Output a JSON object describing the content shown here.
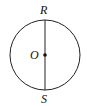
{
  "diagram": {
    "type": "circle-with-diameter",
    "circle": {
      "cx": 45,
      "cy": 55,
      "r": 35,
      "stroke": "#222222"
    },
    "diameter": {
      "from": "R",
      "to": "S",
      "orientation": "vertical"
    },
    "points": {
      "R": {
        "label": "R",
        "x": 45,
        "y": 20
      },
      "O": {
        "label": "O",
        "x": 45,
        "y": 55
      },
      "S": {
        "label": "S",
        "x": 45,
        "y": 90
      }
    },
    "center_point": "O"
  }
}
